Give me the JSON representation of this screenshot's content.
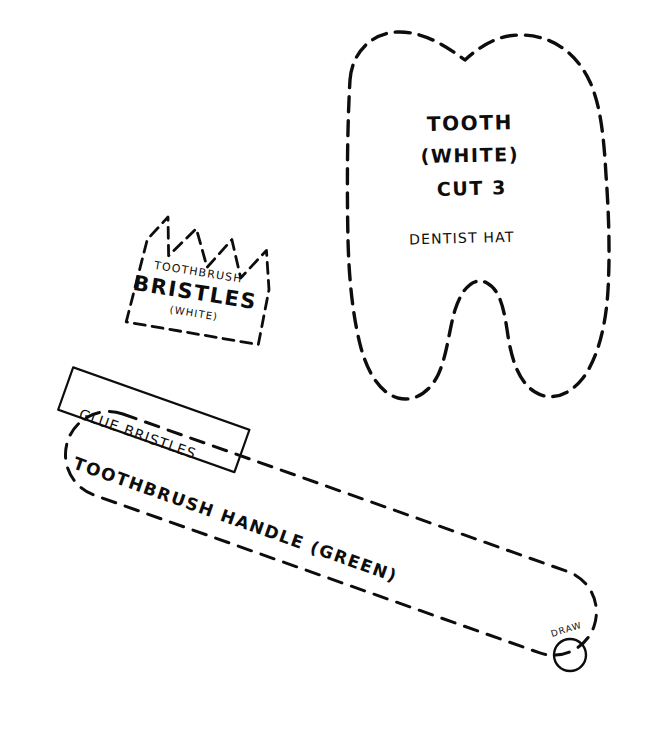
{
  "sheet": {
    "title": "Hand-drawn craft pattern template sheet",
    "background_color": "#ffffff",
    "ink_color": "#0d0d0d"
  },
  "pieces": {
    "tooth": {
      "name": "Tooth piece",
      "labels": {
        "line1": "TOOTH",
        "line2": "(WHITE)",
        "line3": "CUT 3",
        "line4": "DENTIST HAT"
      },
      "outline_style": "dashed"
    },
    "bristles": {
      "name": "Toothbrush bristles piece",
      "labels": {
        "line1": "TOOTHBRUSH",
        "line2": "BRISTLES",
        "line3": "(WHITE)"
      },
      "outline_style": "dashed-zigzag-top"
    },
    "handle": {
      "name": "Toothbrush handle piece",
      "labels": {
        "glue_box": "GLUE BRISTLES",
        "main": "TOOTHBRUSH HANDLE (GREEN)",
        "hole": "DRAW"
      },
      "outline_style": "dashed-stadium"
    }
  }
}
